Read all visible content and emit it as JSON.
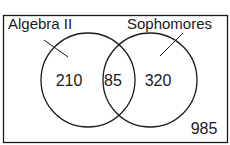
{
  "diagram": {
    "type": "venn",
    "universe": {
      "outside_count": "985"
    },
    "sets": [
      {
        "name": "Algebra II",
        "only_count": "210"
      },
      {
        "name": "Sophomores",
        "only_count": "320"
      }
    ],
    "intersection_count": "85",
    "colors": {
      "stroke": "#1a1a1a",
      "background": "#ffffff",
      "text": "#1a1a1a"
    }
  }
}
